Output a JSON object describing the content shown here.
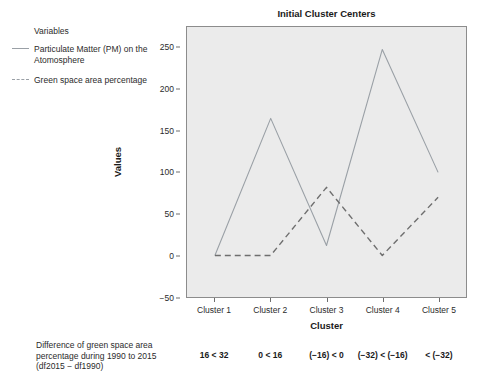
{
  "chart_data": {
    "type": "line",
    "title": "Initial Cluster Centers",
    "xlabel": "Cluster",
    "ylabel": "Values",
    "categories": [
      "Cluster 1",
      "Cluster 2",
      "Cluster 3",
      "Cluster 4",
      "Cluster 5"
    ],
    "series": [
      {
        "name": "Particulate Matter (PM) on the Atomosphere",
        "style": "solid",
        "color": "#9aa0a6",
        "values": [
          0,
          165,
          12,
          248,
          100
        ]
      },
      {
        "name": "Green space area percentage",
        "style": "dashed",
        "color": "#6e6e6e",
        "values": [
          0,
          0,
          82,
          0,
          70
        ]
      }
    ],
    "ylim": [
      -50,
      275
    ],
    "yticks": [
      -50,
      0,
      50,
      100,
      150,
      200,
      250
    ],
    "ytick_labels": [
      "−50",
      "0",
      "50",
      "100",
      "150",
      "200",
      "250"
    ],
    "grid": false,
    "legend_position": "left-outside",
    "panel_background": "#ebebeb"
  },
  "legend": {
    "title": "Variables",
    "entries": [
      {
        "label": "Particulate Matter (PM) on the Atomosphere",
        "style": "solid"
      },
      {
        "label": "Green space area percentage",
        "style": "dashed"
      }
    ]
  },
  "footnote": {
    "description": "Difference of green space area percentage during 1990 to 2015 (df2015 − df1990)",
    "values": [
      "16 < 32",
      "0 < 16",
      "(−16) < 0",
      "(−32) < (−16)",
      "< (−32)"
    ]
  }
}
